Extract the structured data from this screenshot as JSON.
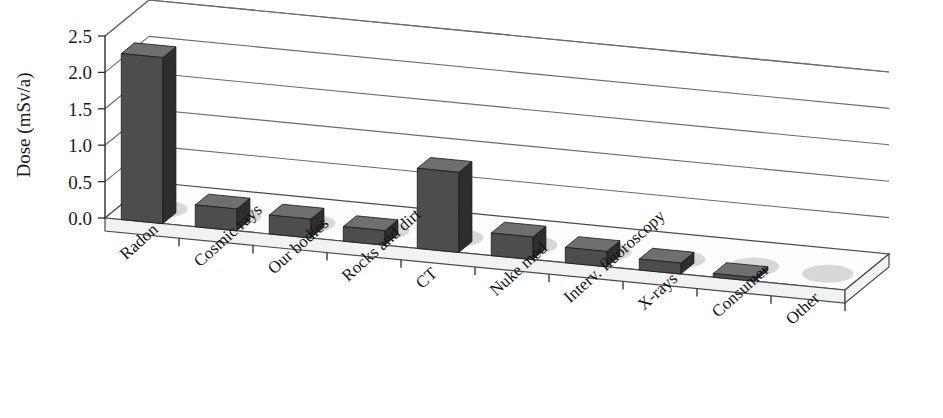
{
  "chart_data": {
    "type": "bar",
    "title": "",
    "xlabel": "",
    "ylabel": "Dose (mSv/a)",
    "ylim": [
      0.0,
      2.5
    ],
    "ytick_values": [
      0.0,
      0.5,
      1.0,
      1.5,
      2.0,
      2.5
    ],
    "ytick_labels": [
      "0.0",
      "0.5",
      "1.0",
      "1.5",
      "2.0",
      "2.5"
    ],
    "grid": true,
    "legend": "none",
    "projection": "3d",
    "categories": [
      "Radon",
      "Cosmic rays",
      "Our bodies",
      "Rocks and dirt",
      "CT",
      "Nuke med",
      "Interv. fluoroscopy",
      "X-rays",
      "Consumer",
      "Other"
    ],
    "values": [
      2.28,
      0.3,
      0.26,
      0.2,
      1.1,
      0.31,
      0.21,
      0.15,
      0.05,
      0.0
    ],
    "bar_color": "#4d4d4d",
    "bar_side_color": "#2e2e2e",
    "bar_top_color": "#6f6f6f",
    "grid_color": "#6b6b6b",
    "axis_color": "#2b2b2b",
    "background_color": "#ffffff"
  },
  "axis": {
    "y_title": "Dose (mSv/a)"
  }
}
